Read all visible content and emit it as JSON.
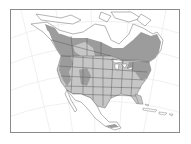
{
  "map": {
    "subject": "North America range map",
    "colors": {
      "background": "#ffffff",
      "frame": "#8a8a8a",
      "graticule": "#e4e4e4",
      "land_outside_range": "#ffffff",
      "range_dark": "#9c9c9c",
      "range_light": "#c6c6c6",
      "borders": "#555555",
      "coast": "#6a6a6a"
    },
    "regions": [
      {
        "name": "canada-boreal-range",
        "shade": "range_dark"
      },
      {
        "name": "alaska-southeast-coast-range",
        "shade": "range_dark"
      },
      {
        "name": "northeast-us-range",
        "shade": "range_dark"
      },
      {
        "name": "western-mountains-range",
        "shade": "range_dark"
      },
      {
        "name": "prairie-light-range",
        "shade": "range_light"
      },
      {
        "name": "contiguous-us-light-range",
        "shade": "range_light"
      },
      {
        "name": "central-america-patch",
        "shade": "range_dark"
      }
    ]
  }
}
